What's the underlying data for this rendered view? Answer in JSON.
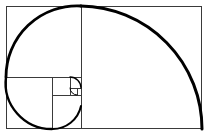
{
  "figure": {
    "background_color": "#ffffff",
    "grid_stroke_color": "#3a3a3a",
    "spiral_stroke_color": "#000000",
    "frame": {
      "x": 6,
      "y": 6,
      "width": 196,
      "height": 123
    },
    "squares": [
      {
        "name": "square-1",
        "x": 6,
        "y": 6,
        "size": 123,
        "label": ""
      },
      {
        "name": "square-2",
        "x": 81,
        "y": 6,
        "size": 71,
        "label": ""
      },
      {
        "name": "square-3",
        "x": 6,
        "y": 77,
        "size": 46,
        "label": ""
      },
      {
        "name": "square-4",
        "x": 52,
        "y": 77,
        "size": 29,
        "label": ""
      },
      {
        "name": "square-5",
        "x": 52,
        "y": 77,
        "size": 18,
        "label": ""
      },
      {
        "name": "square-6",
        "x": 70,
        "y": 77,
        "size": 11,
        "label": ""
      },
      {
        "name": "square-7",
        "x": 70,
        "y": 88,
        "size": 7,
        "label": ""
      }
    ],
    "dividers": [
      {
        "name": "divider-vertical-major",
        "x1": 81,
        "y1": 6,
        "x2": 81,
        "y2": 129
      },
      {
        "name": "divider-horizontal-major",
        "x1": 6,
        "y1": 77,
        "x2": 81,
        "y2": 77
      },
      {
        "name": "divider-vertical-minor",
        "x1": 52,
        "y1": 77,
        "x2": 52,
        "y2": 129
      },
      {
        "name": "divider-horizontal-minor",
        "x1": 52,
        "y1": 95,
        "x2": 81,
        "y2": 95
      },
      {
        "name": "divider-vertical-micro",
        "x1": 70,
        "y1": 77,
        "x2": 70,
        "y2": 95
      },
      {
        "name": "divider-horizontal-micro",
        "x1": 70,
        "y1": 88,
        "x2": 81,
        "y2": 88
      }
    ],
    "arcs": [
      {
        "name": "arc-largest",
        "from": [
          81,
          6
        ],
        "to": [
          202,
          129
        ],
        "radius": 123,
        "sweep": 1
      },
      {
        "name": "arc-second",
        "from": [
          6,
          77
        ],
        "to": [
          81,
          6
        ],
        "radius": 71,
        "sweep": 1
      },
      {
        "name": "arc-third",
        "from": [
          52,
          129
        ],
        "to": [
          6,
          77
        ],
        "radius": 46,
        "sweep": 1
      },
      {
        "name": "arc-fourth",
        "from": [
          81,
          106
        ],
        "to": [
          52,
          129
        ],
        "radius": 29,
        "sweep": 1
      },
      {
        "name": "arc-fifth",
        "from": [
          70,
          77
        ],
        "to": [
          81,
          88
        ],
        "radius": 11,
        "sweep": 1
      },
      {
        "name": "arc-sixth",
        "from": [
          77,
          95
        ],
        "to": [
          70,
          88
        ],
        "radius": 7,
        "sweep": 1
      }
    ]
  }
}
